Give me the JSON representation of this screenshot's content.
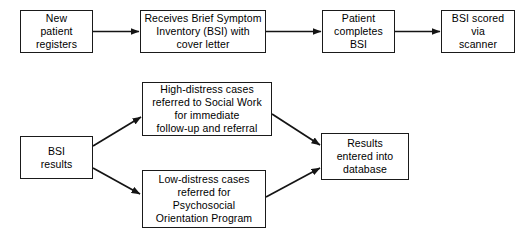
{
  "diagram": {
    "background_color": "#ffffff",
    "stroke_color": "#1a1a1a",
    "text_color": "#000000",
    "nodes": {
      "new_patient": "New\npatient\nregisters",
      "receives_bsi": "Receives Brief Symptom\nInventory (BSI) with\ncover letter",
      "patient_completes": "Patient\ncompletes\nBSI",
      "bsi_scored": "BSI scored\nvia\nscanner",
      "bsi_results": "BSI\nresults",
      "high_distress": "High-distress cases\nreferred to Social Work\nfor immediate\nfollow-up and referral",
      "low_distress": "Low-distress cases\nreferred for\nPsychosocial\nOrientation Program",
      "results_db": "Results\nentered into\ndatabase"
    },
    "edges": [
      {
        "name": "new-patient-to-receives-bsi",
        "from": "new_patient",
        "to": "receives_bsi",
        "style": "straight-horizontal"
      },
      {
        "name": "receives-bsi-to-patient-completes",
        "from": "receives_bsi",
        "to": "patient_completes",
        "style": "straight-horizontal"
      },
      {
        "name": "patient-completes-to-bsi-scored",
        "from": "patient_completes",
        "to": "bsi_scored",
        "style": "straight-horizontal"
      },
      {
        "name": "bsi-results-to-high-distress",
        "from": "bsi_results",
        "to": "high_distress",
        "style": "diagonal-up"
      },
      {
        "name": "bsi-results-to-low-distress",
        "from": "bsi_results",
        "to": "low_distress",
        "style": "diagonal-down"
      },
      {
        "name": "high-distress-to-results-db",
        "from": "high_distress",
        "to": "results_db",
        "style": "diagonal-down"
      },
      {
        "name": "low-distress-to-results-db",
        "from": "low_distress",
        "to": "results_db",
        "style": "diagonal-up"
      }
    ]
  }
}
